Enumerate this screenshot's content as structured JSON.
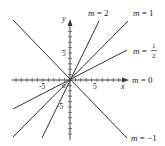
{
  "diagram": {
    "title": "",
    "origin_px": [
      70,
      80
    ],
    "unit_px": 5.4,
    "axes": {
      "x_label": "x",
      "y_label": "y",
      "x_ticks": [
        "-5",
        "5"
      ],
      "y_ticks": [
        "5",
        "-5"
      ],
      "origin_label": "0"
    },
    "lines": [
      {
        "slope": 2,
        "label": "m = 2",
        "label_var": "m",
        "label_val": "2"
      },
      {
        "slope": 1,
        "label": "m = 1",
        "label_var": "m",
        "label_val": "1"
      },
      {
        "slope": 0.5,
        "label": "m = 1/2",
        "label_var": "m",
        "label_num": "1",
        "label_den": "2"
      },
      {
        "slope": 0,
        "label": "m = 0",
        "label_var": "m",
        "label_val": "0"
      },
      {
        "slope": -1,
        "label": "m = −1",
        "label_var": "m",
        "label_val": "−1"
      }
    ],
    "colors": {
      "line": "#333333",
      "axis": "#444444"
    }
  }
}
